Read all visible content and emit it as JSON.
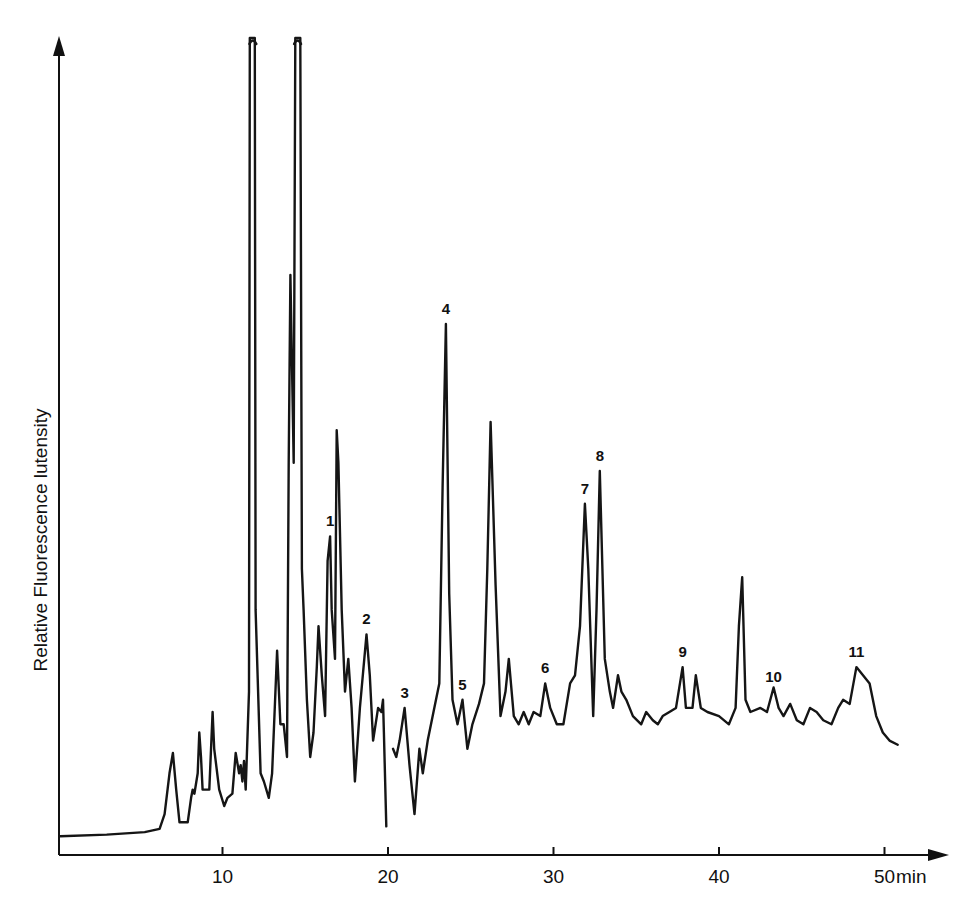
{
  "chart_data": {
    "type": "line",
    "title": "",
    "xlabel": "min",
    "ylabel": "Relative Fluorescence lutensity",
    "x_ticks": [
      10,
      20,
      30,
      40,
      50
    ],
    "x_tick_labels": [
      "10",
      "20",
      "30",
      "40",
      "50"
    ],
    "xlim": [
      0,
      53
    ],
    "y_ticks": [],
    "ylim": [
      0,
      100
    ],
    "grid": false,
    "legend": null,
    "peaks": [
      {
        "label": "1",
        "time_min": 16.5,
        "rel_intensity": 39
      },
      {
        "label": "2",
        "time_min": 18.7,
        "rel_intensity": 27
      },
      {
        "label": "3",
        "time_min": 21.0,
        "rel_intensity": 18
      },
      {
        "label": "4",
        "time_min": 23.5,
        "rel_intensity": 65
      },
      {
        "label": "5",
        "time_min": 24.5,
        "rel_intensity": 19
      },
      {
        "label": "6",
        "time_min": 29.5,
        "rel_intensity": 21
      },
      {
        "label": "7",
        "time_min": 31.9,
        "rel_intensity": 43
      },
      {
        "label": "8",
        "time_min": 32.8,
        "rel_intensity": 47
      },
      {
        "label": "9",
        "time_min": 37.8,
        "rel_intensity": 23
      },
      {
        "label": "10",
        "time_min": 43.3,
        "rel_intensity": 20
      },
      {
        "label": "11",
        "time_min": 48.3,
        "rel_intensity": 23
      }
    ],
    "unlabeled_major_peaks": [
      {
        "time_min": 7.0,
        "rel_intensity": 12
      },
      {
        "time_min": 9.2,
        "rel_intensity": 17
      },
      {
        "time_min": 11.8,
        "rel_intensity": 100,
        "off_scale": true
      },
      {
        "time_min": 13.3,
        "rel_intensity": 25
      },
      {
        "time_min": 14.1,
        "rel_intensity": 71
      },
      {
        "time_min": 14.5,
        "rel_intensity": 100,
        "off_scale": true
      },
      {
        "time_min": 16.9,
        "rel_intensity": 52
      },
      {
        "time_min": 26.2,
        "rel_intensity": 53
      },
      {
        "time_min": 41.4,
        "rel_intensity": 34
      }
    ],
    "series": [
      {
        "name": "fluorescence trace",
        "segments": [
          [
            [
              0.2,
              2.3
            ],
            [
              3.0,
              2.5
            ],
            [
              5.3,
              2.8
            ],
            [
              6.2,
              3.2
            ],
            [
              6.5,
              5
            ],
            [
              6.8,
              10
            ],
            [
              7.0,
              12.5
            ],
            [
              7.2,
              8
            ],
            [
              7.4,
              4
            ],
            [
              7.9,
              4
            ],
            [
              8.1,
              7
            ],
            [
              8.2,
              8
            ],
            [
              8.3,
              7.5
            ],
            [
              8.5,
              10
            ],
            [
              8.6,
              15
            ],
            [
              8.7,
              12
            ],
            [
              8.8,
              8
            ],
            [
              9.2,
              8
            ],
            [
              9.4,
              17.5
            ],
            [
              9.5,
              13
            ],
            [
              9.8,
              8
            ],
            [
              10.1,
              6
            ],
            [
              10.3,
              7
            ],
            [
              10.6,
              7.5
            ],
            [
              10.8,
              12.5
            ],
            [
              11.0,
              10
            ],
            [
              11.1,
              11
            ],
            [
              11.2,
              9
            ],
            [
              11.3,
              11.5
            ],
            [
              11.4,
              8
            ],
            [
              11.6,
              20
            ],
            [
              11.65,
              100
            ],
            [
              11.95,
              100
            ],
            [
              12.0,
              30
            ],
            [
              12.3,
              10
            ],
            [
              12.5,
              9
            ],
            [
              12.8,
              7
            ],
            [
              13.0,
              10
            ],
            [
              13.3,
              25
            ],
            [
              13.5,
              16
            ],
            [
              13.7,
              16
            ],
            [
              13.9,
              12
            ],
            [
              14.0,
              48
            ],
            [
              14.1,
              71
            ],
            [
              14.3,
              48
            ],
            [
              14.4,
              100
            ],
            [
              14.7,
              100
            ],
            [
              14.8,
              35
            ],
            [
              14.9,
              30
            ],
            [
              15.1,
              19
            ],
            [
              15.3,
              12
            ],
            [
              15.5,
              15
            ],
            [
              15.7,
              23
            ],
            [
              15.8,
              28
            ],
            [
              16.0,
              22
            ],
            [
              16.2,
              17
            ],
            [
              16.35,
              36
            ],
            [
              16.5,
              39
            ],
            [
              16.6,
              30
            ],
            [
              16.8,
              24
            ],
            [
              16.9,
              52
            ],
            [
              17.0,
              48
            ],
            [
              17.2,
              30
            ],
            [
              17.4,
              20
            ],
            [
              17.6,
              24
            ],
            [
              17.8,
              18
            ],
            [
              18.0,
              9
            ],
            [
              18.3,
              18
            ],
            [
              18.7,
              27
            ],
            [
              18.9,
              22
            ],
            [
              19.1,
              14
            ],
            [
              19.4,
              18
            ],
            [
              19.6,
              17.5
            ],
            [
              19.7,
              19
            ],
            [
              19.75,
              15
            ],
            [
              19.9,
              3.5
            ]
          ],
          [
            [
              20.3,
              13
            ],
            [
              20.5,
              12
            ],
            [
              20.7,
              14
            ],
            [
              21.0,
              18
            ],
            [
              21.3,
              11
            ],
            [
              21.6,
              5
            ],
            [
              21.9,
              13
            ],
            [
              22.1,
              10
            ],
            [
              22.4,
              14
            ],
            [
              22.8,
              18
            ],
            [
              23.1,
              21
            ],
            [
              23.3,
              45
            ],
            [
              23.5,
              65
            ],
            [
              23.7,
              32
            ],
            [
              23.9,
              19
            ],
            [
              24.2,
              16
            ],
            [
              24.5,
              19
            ],
            [
              24.8,
              13
            ],
            [
              25.1,
              16
            ],
            [
              25.5,
              18.5
            ],
            [
              25.8,
              21
            ],
            [
              26.0,
              35
            ],
            [
              26.2,
              53
            ],
            [
              26.5,
              33
            ],
            [
              26.8,
              17
            ],
            [
              27.1,
              20
            ],
            [
              27.3,
              24
            ],
            [
              27.6,
              17
            ],
            [
              27.9,
              16
            ],
            [
              28.2,
              17.5
            ],
            [
              28.5,
              16
            ],
            [
              28.8,
              17.5
            ],
            [
              29.2,
              17
            ],
            [
              29.5,
              21
            ],
            [
              29.8,
              18
            ],
            [
              30.2,
              16
            ],
            [
              30.6,
              16
            ],
            [
              31.0,
              21
            ],
            [
              31.3,
              22
            ],
            [
              31.6,
              28
            ],
            [
              31.9,
              43
            ],
            [
              32.1,
              35
            ],
            [
              32.4,
              17
            ],
            [
              32.6,
              30
            ],
            [
              32.8,
              47
            ],
            [
              33.1,
              24
            ],
            [
              33.4,
              20
            ],
            [
              33.6,
              18
            ],
            [
              33.9,
              22
            ],
            [
              34.1,
              20
            ],
            [
              34.4,
              19
            ],
            [
              34.8,
              17
            ],
            [
              35.3,
              16
            ],
            [
              35.6,
              17.5
            ],
            [
              36.0,
              16.5
            ],
            [
              36.3,
              16
            ],
            [
              36.6,
              17
            ],
            [
              37.0,
              17.5
            ],
            [
              37.4,
              18
            ],
            [
              37.8,
              23
            ],
            [
              38.0,
              18
            ],
            [
              38.4,
              18
            ],
            [
              38.6,
              22
            ],
            [
              38.9,
              18
            ],
            [
              39.3,
              17.5
            ],
            [
              40.0,
              17
            ],
            [
              40.6,
              16
            ],
            [
              41.0,
              18
            ],
            [
              41.2,
              28
            ],
            [
              41.4,
              34
            ],
            [
              41.6,
              19
            ],
            [
              41.9,
              17.5
            ],
            [
              42.5,
              18
            ],
            [
              42.9,
              17.5
            ],
            [
              43.3,
              20.5
            ],
            [
              43.6,
              18
            ],
            [
              43.9,
              17
            ],
            [
              44.3,
              18.5
            ],
            [
              44.7,
              16.5
            ],
            [
              45.1,
              16
            ],
            [
              45.5,
              18
            ],
            [
              45.9,
              17.5
            ],
            [
              46.3,
              16.5
            ],
            [
              46.8,
              16
            ],
            [
              47.2,
              18
            ],
            [
              47.5,
              19
            ],
            [
              47.9,
              18.5
            ],
            [
              48.3,
              23
            ],
            [
              48.7,
              22
            ],
            [
              49.1,
              21
            ],
            [
              49.5,
              17
            ],
            [
              49.9,
              15
            ],
            [
              50.3,
              14
            ],
            [
              50.8,
              13.5
            ]
          ]
        ]
      }
    ]
  }
}
